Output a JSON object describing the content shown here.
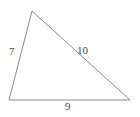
{
  "figure": {
    "type": "triangle-diagram",
    "background_color": "#ffffff",
    "stroke_color": "#8a8a8a",
    "label_color": "#4a4a4a",
    "stroke_width": 1,
    "vertices": {
      "apex": {
        "x": 32,
        "y": 11
      },
      "bottom_left": {
        "x": 9,
        "y": 100
      },
      "bottom_right": {
        "x": 130,
        "y": 100
      }
    },
    "sides": {
      "left": {
        "label": "7",
        "from": "bottom_left",
        "to": "apex"
      },
      "hypotenuse": {
        "label": "10",
        "from": "apex",
        "to": "bottom_right"
      },
      "base": {
        "label": "9",
        "from": "bottom_left",
        "to": "bottom_right"
      }
    }
  },
  "chart_data": {
    "type": "diagram",
    "title": "",
    "categories": [
      "left side",
      "right side",
      "base"
    ],
    "values": [
      7,
      10,
      9
    ],
    "labels": [
      "7",
      "10",
      "9"
    ]
  }
}
